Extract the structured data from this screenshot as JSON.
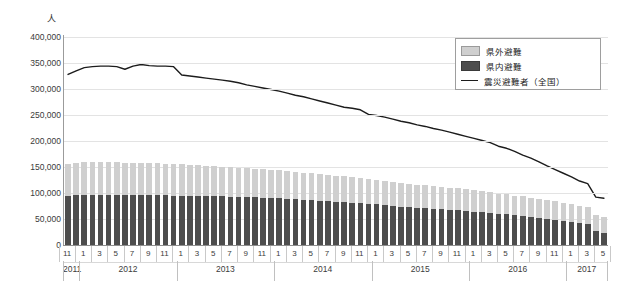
{
  "chart_data": {
    "type": "bar",
    "title": "",
    "subtitle": "",
    "unit_label": "人",
    "ylabel": "人",
    "xlabel": "",
    "ylim": [
      0,
      400000
    ],
    "ytick_labels": [
      "400,000",
      "350,000",
      "300,000",
      "250,000",
      "200,000",
      "150,000",
      "100,000",
      "50,000",
      "0"
    ],
    "ytick_values": [
      400000,
      350000,
      300000,
      250000,
      200000,
      150000,
      100000,
      50000,
      0
    ],
    "grid": true,
    "legend_position": "top-right",
    "stacked": true,
    "categories": [
      "2011/11",
      "2011/12",
      "2012/1",
      "2012/2",
      "2012/3",
      "2012/4",
      "2012/5",
      "2012/6",
      "2012/7",
      "2012/8",
      "2012/9",
      "2012/10",
      "2012/11",
      "2012/12",
      "2013/1",
      "2013/2",
      "2013/3",
      "2013/4",
      "2013/5",
      "2013/6",
      "2013/7",
      "2013/8",
      "2013/9",
      "2013/10",
      "2013/11",
      "2013/12",
      "2014/1",
      "2014/2",
      "2014/3",
      "2014/4",
      "2014/5",
      "2014/6",
      "2014/7",
      "2014/8",
      "2014/9",
      "2014/10",
      "2014/11",
      "2014/12",
      "2015/1",
      "2015/2",
      "2015/3",
      "2015/4",
      "2015/5",
      "2015/6",
      "2015/7",
      "2015/8",
      "2015/9",
      "2015/10",
      "2015/11",
      "2015/12",
      "2016/1",
      "2016/2",
      "2016/3",
      "2016/4",
      "2016/5",
      "2016/6",
      "2016/7",
      "2016/8",
      "2016/9",
      "2016/10",
      "2016/11",
      "2016/12",
      "2017/1",
      "2017/2",
      "2017/3",
      "2017/4",
      "2017/5"
    ],
    "month_ticks": [
      {
        "index": 0,
        "label": "11"
      },
      {
        "index": 2,
        "label": "1"
      },
      {
        "index": 4,
        "label": "3"
      },
      {
        "index": 6,
        "label": "5"
      },
      {
        "index": 8,
        "label": "7"
      },
      {
        "index": 10,
        "label": "9"
      },
      {
        "index": 12,
        "label": "11"
      },
      {
        "index": 14,
        "label": "1"
      },
      {
        "index": 16,
        "label": "3"
      },
      {
        "index": 18,
        "label": "5"
      },
      {
        "index": 20,
        "label": "7"
      },
      {
        "index": 22,
        "label": "9"
      },
      {
        "index": 24,
        "label": "11"
      },
      {
        "index": 26,
        "label": "1"
      },
      {
        "index": 28,
        "label": "3"
      },
      {
        "index": 30,
        "label": "5"
      },
      {
        "index": 32,
        "label": "7"
      },
      {
        "index": 34,
        "label": "9"
      },
      {
        "index": 36,
        "label": "11"
      },
      {
        "index": 38,
        "label": "1"
      },
      {
        "index": 40,
        "label": "3"
      },
      {
        "index": 42,
        "label": "5"
      },
      {
        "index": 44,
        "label": "7"
      },
      {
        "index": 46,
        "label": "9"
      },
      {
        "index": 48,
        "label": "11"
      },
      {
        "index": 50,
        "label": "1"
      },
      {
        "index": 52,
        "label": "3"
      },
      {
        "index": 54,
        "label": "5"
      },
      {
        "index": 56,
        "label": "7"
      },
      {
        "index": 58,
        "label": "9"
      },
      {
        "index": 60,
        "label": "11"
      },
      {
        "index": 62,
        "label": "1"
      },
      {
        "index": 64,
        "label": "3"
      },
      {
        "index": 66,
        "label": "5"
      }
    ],
    "year_groups": [
      {
        "label": "2011",
        "start": 0,
        "end": 1
      },
      {
        "label": "2012",
        "start": 2,
        "end": 13
      },
      {
        "label": "2013",
        "start": 14,
        "end": 25
      },
      {
        "label": "2014",
        "start": 26,
        "end": 37
      },
      {
        "label": "2015",
        "start": 38,
        "end": 49
      },
      {
        "label": "2016",
        "start": 50,
        "end": 61
      },
      {
        "label": "2017",
        "start": 62,
        "end": 66
      }
    ],
    "series": [
      {
        "name": "県内避難",
        "type": "bar",
        "stack": "evac",
        "color": "#4d4d4d",
        "values": [
          95000,
          96000,
          97000,
          97000,
          97000,
          97000,
          97000,
          96000,
          96000,
          96000,
          96000,
          96000,
          96000,
          95000,
          95000,
          95000,
          95000,
          94000,
          94000,
          94000,
          93000,
          93000,
          92000,
          92000,
          91000,
          91000,
          90000,
          89000,
          88000,
          87000,
          86000,
          85000,
          84000,
          83000,
          82000,
          81000,
          80000,
          79000,
          78000,
          77000,
          75000,
          74000,
          73000,
          72000,
          71000,
          70000,
          69000,
          68000,
          67000,
          66000,
          64000,
          63000,
          62000,
          60000,
          59000,
          57000,
          56000,
          54000,
          52000,
          50000,
          48000,
          46000,
          44000,
          42000,
          40000,
          26000,
          23000
        ]
      },
      {
        "name": "県外避難",
        "type": "bar",
        "stack": "evac",
        "color": "#cfcfcf",
        "values": [
          60000,
          61000,
          62000,
          62000,
          62000,
          62000,
          62000,
          61000,
          61000,
          61000,
          61000,
          61000,
          60000,
          60000,
          60000,
          59000,
          59000,
          58000,
          58000,
          57000,
          57000,
          56000,
          56000,
          55000,
          55000,
          54000,
          54000,
          53000,
          53000,
          52000,
          52000,
          51000,
          51000,
          50000,
          50000,
          49000,
          49000,
          48000,
          47000,
          47000,
          46000,
          45000,
          45000,
          44000,
          44000,
          43000,
          43000,
          42000,
          42000,
          41000,
          41000,
          40000,
          40000,
          39000,
          39000,
          38000,
          38000,
          37000,
          37000,
          36000,
          36000,
          35000,
          35000,
          34000,
          34000,
          31000,
          31000
        ]
      },
      {
        "name": "震災避難者（全国）",
        "type": "line",
        "color": "#1c1c1c",
        "values": [
          328000,
          335000,
          341000,
          343000,
          344000,
          344000,
          343000,
          338000,
          344000,
          347000,
          345000,
          344000,
          344000,
          343000,
          327000,
          325000,
          323000,
          321000,
          319000,
          317000,
          315000,
          312000,
          308000,
          305000,
          302000,
          299000,
          296000,
          292000,
          288000,
          285000,
          281000,
          277000,
          273000,
          269000,
          265000,
          263000,
          260000,
          251000,
          249000,
          246000,
          242000,
          238000,
          235000,
          231000,
          228000,
          224000,
          221000,
          217000,
          213000,
          209000,
          205000,
          201000,
          197000,
          190000,
          186000,
          180000,
          173000,
          167000,
          160000,
          152000,
          145000,
          138000,
          131000,
          123000,
          118000,
          92000,
          90000
        ]
      }
    ],
    "legend": [
      {
        "label": "県外避難",
        "marker": "swatch",
        "color": "#cfcfcf"
      },
      {
        "label": "県内避難",
        "marker": "swatch",
        "color": "#4d4d4d"
      },
      {
        "label": "震災避難者（全国）",
        "marker": "line",
        "color": "#1c1c1c"
      }
    ]
  },
  "source_note": ""
}
